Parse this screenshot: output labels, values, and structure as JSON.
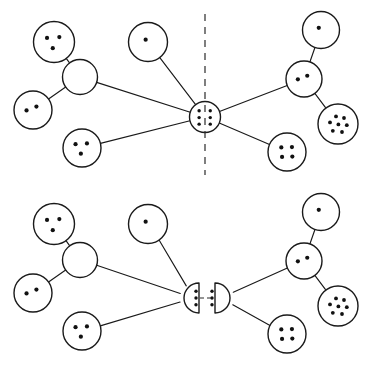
{
  "figure": {
    "background_color": "#ffffff",
    "stroke_color": "#1a1a1a",
    "dot_color": "#111111",
    "width": 375,
    "height": 367
  },
  "chart_data": {
    "type": "diagram",
    "panels": [
      {
        "id": "upper",
        "label": "before-split",
        "divider": {
          "kind": "vertical-dashed-cut",
          "x": 205,
          "y_top": 14,
          "y_bottom": 175,
          "dash": "7 6"
        },
        "hub": {
          "id": "hub",
          "shape": "circle",
          "cx": 205,
          "cy": 117,
          "r": 15.5,
          "dots": 6,
          "dot_layout": "two-columns-of-three"
        },
        "nodes": [
          {
            "id": "u-nw-leaf",
            "shape": "circle",
            "cx": 54,
            "cy": 42,
            "r": 20.5,
            "dots": 3,
            "dot_layout": "triangle"
          },
          {
            "id": "u-w-center",
            "shape": "circle",
            "cx": 80,
            "cy": 77,
            "r": 17.5,
            "dots": 0,
            "dot_layout": "empty"
          },
          {
            "id": "u-w-leaf",
            "shape": "circle",
            "cx": 33,
            "cy": 110,
            "r": 19.0,
            "dots": 2,
            "dot_layout": "pair"
          },
          {
            "id": "u-sw-leaf",
            "shape": "circle",
            "cx": 82,
            "cy": 148,
            "r": 19.0,
            "dots": 3,
            "dot_layout": "triangle"
          },
          {
            "id": "u-n-leaf",
            "shape": "circle",
            "cx": 148,
            "cy": 42,
            "r": 19.5,
            "dots": 1,
            "dot_layout": "single"
          },
          {
            "id": "u-ne-leaf",
            "shape": "circle",
            "cx": 321,
            "cy": 30,
            "r": 18.5,
            "dots": 1,
            "dot_layout": "single"
          },
          {
            "id": "u-e-center",
            "shape": "circle",
            "cx": 304,
            "cy": 79,
            "r": 18.0,
            "dots": 2,
            "dot_layout": "pair"
          },
          {
            "id": "u-e-leaf",
            "shape": "circle",
            "cx": 338,
            "cy": 124,
            "r": 20.0,
            "dots": 7,
            "dot_layout": "cluster-seven"
          },
          {
            "id": "u-se-leaf",
            "shape": "circle",
            "cx": 287,
            "cy": 152,
            "r": 19.0,
            "dots": 4,
            "dot_layout": "diamond-four"
          }
        ],
        "edges": [
          {
            "from": "u-nw-leaf",
            "to": "u-w-center"
          },
          {
            "from": "u-w-leaf",
            "to": "u-w-center"
          },
          {
            "from": "u-w-center",
            "to": "hub"
          },
          {
            "from": "u-sw-leaf",
            "to": "hub"
          },
          {
            "from": "u-n-leaf",
            "to": "hub"
          },
          {
            "from": "hub",
            "to": "u-e-center"
          },
          {
            "from": "u-e-center",
            "to": "u-ne-leaf"
          },
          {
            "from": "u-e-center",
            "to": "u-e-leaf"
          },
          {
            "from": "hub",
            "to": "u-se-leaf"
          }
        ]
      },
      {
        "id": "lower",
        "label": "after-split",
        "link": {
          "kind": "horizontal-dashed-link",
          "x_left": 200,
          "x_right": 214,
          "y": 298,
          "dash": "4 3"
        },
        "hub_left": {
          "id": "hub-left-half",
          "shape": "half-disc",
          "flat_side": "right",
          "cx": 199,
          "cy": 298,
          "r": 15.0,
          "dots": 3,
          "dot_layout": "vertical-column-of-three"
        },
        "hub_right": {
          "id": "hub-right-half",
          "shape": "half-disc",
          "flat_side": "left",
          "cx": 215,
          "cy": 298,
          "r": 15.0,
          "dots": 3,
          "dot_layout": "vertical-column-of-three"
        },
        "nodes": [
          {
            "id": "l-nw-leaf",
            "shape": "circle",
            "cx": 54,
            "cy": 224,
            "r": 20.5,
            "dots": 3,
            "dot_layout": "triangle"
          },
          {
            "id": "l-w-center",
            "shape": "circle",
            "cx": 80,
            "cy": 260,
            "r": 17.5,
            "dots": 0,
            "dot_layout": "empty"
          },
          {
            "id": "l-w-leaf",
            "shape": "circle",
            "cx": 33,
            "cy": 293,
            "r": 19.0,
            "dots": 2,
            "dot_layout": "pair"
          },
          {
            "id": "l-sw-leaf",
            "shape": "circle",
            "cx": 82,
            "cy": 331,
            "r": 19.0,
            "dots": 3,
            "dot_layout": "triangle"
          },
          {
            "id": "l-n-leaf",
            "shape": "circle",
            "cx": 148,
            "cy": 224,
            "r": 19.5,
            "dots": 1,
            "dot_layout": "single"
          },
          {
            "id": "l-ne-leaf",
            "shape": "circle",
            "cx": 321,
            "cy": 212,
            "r": 18.5,
            "dots": 1,
            "dot_layout": "single"
          },
          {
            "id": "l-e-center",
            "shape": "circle",
            "cx": 304,
            "cy": 261,
            "r": 18.0,
            "dots": 2,
            "dot_layout": "pair"
          },
          {
            "id": "l-e-leaf",
            "shape": "circle",
            "cx": 338,
            "cy": 306,
            "r": 20.0,
            "dots": 7,
            "dot_layout": "cluster-seven"
          },
          {
            "id": "l-se-leaf",
            "shape": "circle",
            "cx": 287,
            "cy": 334,
            "r": 19.0,
            "dots": 4,
            "dot_layout": "diamond-four"
          }
        ],
        "edges": [
          {
            "from": "l-nw-leaf",
            "to": "l-w-center"
          },
          {
            "from": "l-w-leaf",
            "to": "l-w-center"
          },
          {
            "from": "l-w-center",
            "to": "hub-left-half"
          },
          {
            "from": "l-sw-leaf",
            "to": "hub-left-half"
          },
          {
            "from": "l-n-leaf",
            "to": "hub-left-half"
          },
          {
            "from": "hub-right-half",
            "to": "l-e-center"
          },
          {
            "from": "l-e-center",
            "to": "l-ne-leaf"
          },
          {
            "from": "l-e-center",
            "to": "l-e-leaf"
          },
          {
            "from": "hub-right-half",
            "to": "l-se-leaf"
          }
        ]
      }
    ]
  }
}
